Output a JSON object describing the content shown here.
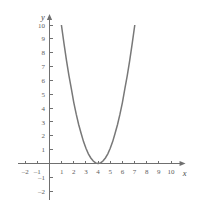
{
  "chart_data": {
    "type": "line",
    "title": "",
    "xlabel": "x",
    "ylabel": "y",
    "grid": false,
    "legend": "none",
    "xlim": [
      -2.6,
      11.2
    ],
    "ylim": [
      -2.6,
      10.8
    ],
    "xticks": [
      -2,
      -1,
      1,
      2,
      3,
      4,
      5,
      6,
      7,
      8,
      9,
      10
    ],
    "xtick_labels": [
      "-2",
      "-1",
      "1",
      "2",
      "3",
      "4",
      "5",
      "6",
      "7",
      "8",
      "9",
      "10"
    ],
    "yticks": [
      -2,
      -1,
      1,
      2,
      3,
      4,
      5,
      6,
      7,
      8,
      9,
      10
    ],
    "ytick_labels": [
      "-2",
      "-1",
      "1",
      "2",
      "3",
      "4",
      "5",
      "6",
      "7",
      "8",
      "9",
      "10"
    ],
    "series": [
      {
        "name": "parabola",
        "equation": "y = 1.1(x - 4)^2",
        "vertex": [
          4,
          0
        ],
        "color": "#787878",
        "x": [
          0.98,
          1.2,
          1.4,
          1.6,
          1.8,
          2.0,
          2.2,
          2.4,
          2.6,
          2.8,
          3.0,
          3.2,
          3.4,
          3.6,
          3.8,
          4.0,
          4.2,
          4.4,
          4.6,
          4.8,
          5.0,
          5.2,
          5.4,
          5.6,
          5.8,
          6.0,
          6.2,
          6.4,
          6.6,
          6.8,
          7.02
        ],
        "y": [
          10.0,
          8.62,
          7.42,
          6.34,
          5.38,
          4.4,
          3.56,
          2.82,
          2.18,
          1.58,
          1.1,
          0.7,
          0.4,
          0.18,
          0.04,
          0.0,
          0.04,
          0.18,
          0.4,
          0.7,
          1.1,
          1.58,
          2.18,
          2.82,
          3.56,
          4.4,
          5.38,
          6.34,
          7.42,
          8.62,
          10.0
        ]
      }
    ],
    "axis_color": "#6f6f6f"
  },
  "labels": {
    "x_axis_name": "x",
    "y_axis_name": "y"
  }
}
